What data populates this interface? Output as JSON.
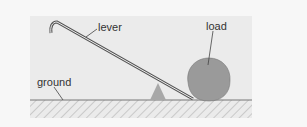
{
  "diagram": {
    "labels": {
      "lever": "lever",
      "load": "load",
      "ground": "ground"
    },
    "colors": {
      "background": "#f7f7f7",
      "panel": "#ebebeb",
      "load_fill": "#9a9a9a",
      "fulcrum_fill": "#a8a8a8",
      "line": "#555555"
    }
  }
}
